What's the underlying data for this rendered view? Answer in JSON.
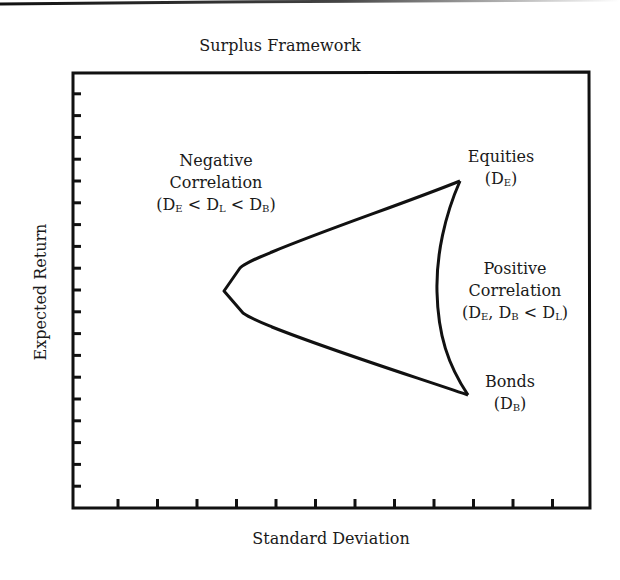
{
  "chart_data": {
    "type": "line",
    "title": "Surplus Framework",
    "xlabel": "Standard Deviation",
    "ylabel": "Expected Return",
    "x_tick_count": 12,
    "y_tick_count": 19,
    "x_tick_labels": [],
    "y_tick_labels": [],
    "grid": false,
    "legend": null,
    "units_note": "No numeric axis labels shown; coordinates expressed in tick units from origin",
    "xlim": [
      0,
      13
    ],
    "ylim": [
      0,
      20
    ],
    "series": [
      {
        "name": "Negative Correlation frontier (upper/lower hyperbola)",
        "x": [
          9.7,
          7.0,
          5.6,
          4.2,
          3.7,
          4.3,
          5.6,
          7.0,
          9.9
        ],
        "y": [
          15.0,
          12.8,
          12.0,
          11.1,
          10.0,
          8.9,
          7.8,
          6.8,
          5.2
        ]
      },
      {
        "name": "Positive Correlation frontier (right curve)",
        "x": [
          9.7,
          9.2,
          9.0,
          9.2,
          9.9
        ],
        "y": [
          15.0,
          12.5,
          10.0,
          7.5,
          5.2
        ]
      }
    ],
    "points": [
      {
        "name": "Equities",
        "x": 9.7,
        "y": 15.0
      },
      {
        "name": "Bonds",
        "x": 9.9,
        "y": 5.2
      },
      {
        "name": "Minimum variance",
        "x": 3.7,
        "y": 10.0
      }
    ],
    "annotations": [
      {
        "text": "Negative Correlation (D_E < D_L < D_B)"
      },
      {
        "text": "Equities (D_E)"
      },
      {
        "text": "Positive Correlation (D_E, D_B < D_L)"
      },
      {
        "text": "Bonds (D_B)"
      }
    ]
  },
  "labels": {
    "title": "Surplus Framework",
    "xlabel": "Standard Deviation",
    "ylabel": "Expected Return",
    "negative": {
      "line1": "Negative",
      "line2": "Correlation",
      "open": "(D",
      "s1": "E",
      "lt1": " < D",
      "s2": "L",
      "lt2": " < D",
      "s3": "B",
      "close": ")"
    },
    "equities": {
      "line1": "Equities",
      "open": "(D",
      "s1": "E",
      "close": ")"
    },
    "positive": {
      "line1": "Positive",
      "line2": "Correlation",
      "open": "(D",
      "s1": "E",
      "mid": ", D",
      "s2": "B",
      "lt": " < D",
      "s3": "L",
      "close": ")"
    },
    "bonds": {
      "line1": "Bonds",
      "open": "(D",
      "s1": "B",
      "close": ")"
    }
  }
}
